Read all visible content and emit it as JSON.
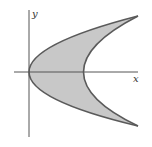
{
  "figure": {
    "axes": {
      "x_label": "x",
      "y_label": "y"
    },
    "curves": [
      {
        "name": "left-parabola",
        "vertex": "origin"
      },
      {
        "name": "right-parabola",
        "vertex": "positive x-axis"
      }
    ],
    "colors": {
      "region_fill": "#c8c8c8",
      "curve_stroke": "#5a5a5a",
      "axis_stroke": "#555555",
      "background": "#ffffff"
    }
  }
}
